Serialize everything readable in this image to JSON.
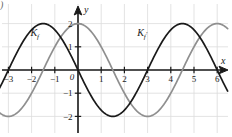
{
  "figure": {
    "corner_mark": ")",
    "axes": {
      "x_axis_label": "x",
      "y_axis_label": "y",
      "origin_label": "0",
      "x_ticks": [
        {
          "value": -3,
          "label": "−3"
        },
        {
          "value": -2,
          "label": "−2"
        },
        {
          "value": -1,
          "label": "−1"
        },
        {
          "value": 1,
          "label": "1"
        },
        {
          "value": 2,
          "label": "2"
        },
        {
          "value": 3,
          "label": "3"
        },
        {
          "value": 4,
          "label": "4"
        },
        {
          "value": 5,
          "label": "5"
        },
        {
          "value": 6,
          "label": "6"
        }
      ],
      "y_ticks": [
        {
          "value": 2,
          "label": "2"
        },
        {
          "value": 1,
          "label": "1"
        },
        {
          "value": -1,
          "label": "−1"
        },
        {
          "value": -2,
          "label": "−2"
        }
      ]
    },
    "curve_labels": [
      {
        "id": "Kf",
        "text": "K",
        "sub": "f",
        "prime": ""
      },
      {
        "id": "Kfprime",
        "text": "K",
        "sub": "f",
        "prime": "′"
      }
    ],
    "colors": {
      "background": "#ffffff",
      "grid": "#dcdcdc",
      "axis": "#1a1a1a",
      "curve_gray": "#8f8f8f",
      "curve_dark": "#1a1a1a",
      "text": "#1a1a1a"
    }
  },
  "chart_data": {
    "type": "line",
    "title": "",
    "xlabel": "x",
    "ylabel": "y",
    "xlim": [
      -3.45,
      6.45
    ],
    "ylim": [
      -2.65,
      2.65
    ],
    "grid": true,
    "legend": "inline-labels",
    "xticks": [
      -3,
      -2,
      -1,
      0,
      1,
      2,
      3,
      4,
      5,
      6
    ],
    "yticks": [
      -2,
      -1,
      1,
      2
    ],
    "series": [
      {
        "name": "K_f",
        "color": "#8f8f8f",
        "formula": "y = 2*cos(pi*x/3)",
        "amplitude": 2,
        "period": 6,
        "phase": 0,
        "label_position": {
          "x": -2.05,
          "y": 1.45
        },
        "x": [
          -3.45,
          -3.2,
          -3.0,
          -2.75,
          -2.5,
          -2.25,
          -2.0,
          -1.75,
          -1.5,
          -1.25,
          -1.0,
          -0.75,
          -0.5,
          -0.25,
          0.0,
          0.25,
          0.5,
          0.75,
          1.0,
          1.25,
          1.5,
          1.75,
          2.0,
          2.25,
          2.5,
          2.75,
          3.0,
          3.25,
          3.5,
          3.75,
          4.0,
          4.25,
          4.5,
          4.75,
          5.0,
          5.25,
          5.5,
          5.75,
          6.0,
          6.25,
          6.45
        ],
        "y": [
          -1.9,
          -1.99,
          -2.0,
          -1.93,
          -1.73,
          -1.41,
          -1.0,
          -0.52,
          0.0,
          0.52,
          1.0,
          1.41,
          1.73,
          1.93,
          2.0,
          1.93,
          1.73,
          1.41,
          1.0,
          0.52,
          0.0,
          -0.52,
          -1.0,
          -1.41,
          -1.73,
          -1.93,
          -2.0,
          -1.93,
          -1.73,
          -1.41,
          -1.0,
          -0.52,
          0.0,
          0.52,
          1.0,
          1.41,
          1.73,
          1.93,
          2.0,
          1.93,
          1.82
        ]
      },
      {
        "name": "K_f'",
        "color": "#1a1a1a",
        "formula": "y = 2*sin(pi*x/3)",
        "amplitude": 2,
        "period": 6,
        "phase": -1.5,
        "label_position": {
          "x": 2.55,
          "y": 1.45
        },
        "x": [
          -3.45,
          -3.2,
          -3.0,
          -2.75,
          -2.5,
          -2.25,
          -2.0,
          -1.75,
          -1.5,
          -1.25,
          -1.0,
          -0.75,
          -0.5,
          -0.25,
          0.0,
          0.25,
          0.5,
          0.75,
          1.0,
          1.25,
          1.5,
          1.75,
          2.0,
          2.25,
          2.5,
          2.75,
          3.0,
          3.25,
          3.5,
          3.75,
          4.0,
          4.25,
          4.5,
          4.75,
          5.0,
          5.25,
          5.5,
          5.75,
          6.0,
          6.25,
          6.45
        ],
        "y": [
          0.62,
          0.21,
          0.0,
          -0.52,
          -1.0,
          -1.41,
          -1.73,
          -1.93,
          -2.0,
          -1.93,
          -1.73,
          -1.41,
          -1.0,
          -0.52,
          0.0,
          0.52,
          1.0,
          1.41,
          1.73,
          1.93,
          2.0,
          1.93,
          1.73,
          1.41,
          1.0,
          0.52,
          0.0,
          -0.52,
          -1.0,
          -1.41,
          -1.73,
          -1.93,
          -2.0,
          -1.93,
          -1.73,
          -1.41,
          -1.0,
          -0.52,
          0.0,
          0.52,
          0.83
        ]
      }
    ]
  }
}
